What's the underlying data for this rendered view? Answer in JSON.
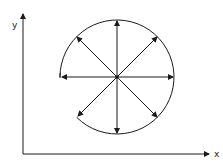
{
  "axes": {
    "x_label": "x",
    "y_label": "y"
  },
  "diagram": {
    "center": [
      117,
      77
    ],
    "radius": 57,
    "arrow_directions_deg": [
      0,
      45,
      90,
      135,
      180,
      225,
      270,
      315
    ],
    "stroke_color": "#1a1a1a"
  }
}
